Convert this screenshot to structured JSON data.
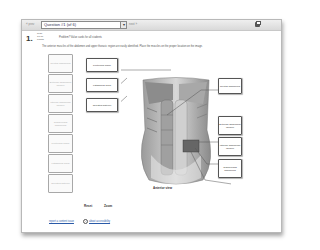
{
  "toolbar": {
    "prev_label": "« prev",
    "question_select": "Question #1 (of 6)",
    "dropdown_arrow": "▾",
    "next_label": "next »",
    "print_icon": "printer-icon"
  },
  "question": {
    "number": "1.",
    "meta": "avail. 10.00 points",
    "guide": "Problem? Value cards for all students",
    "description": "The anterior muscles of the abdomen and upper thoracic region are easily identified. Place the muscles on the proper location on the image."
  },
  "word_bank": [
    {
      "label": "Rectus abdominis"
    },
    {
      "label": "External abdominal oblique"
    },
    {
      "label": "Internal abdominal oblique"
    },
    {
      "label": "Transversus abdominis"
    },
    {
      "label": "Pectoralis major"
    },
    {
      "label": "Latissimus dorsi"
    },
    {
      "label": "Serratus anterior"
    }
  ],
  "left_labels": [
    {
      "label": "Pectoralis major"
    },
    {
      "label": "Latissimus dorsi"
    },
    {
      "label": "Serratus anterior"
    }
  ],
  "right_labels": [
    {
      "label": "Rectus abdominis"
    },
    {
      "label": "External abdominal oblique"
    },
    {
      "label": "Internal abdominal oblique"
    },
    {
      "label": "Transversus abdominis"
    }
  ],
  "figure": {
    "caption": "Anterior view"
  },
  "controls": {
    "reset": "Reset",
    "zoom": "Zoom"
  },
  "footer": {
    "link_a": "report a content issue",
    "help_icon": "?",
    "link_b": "about accessibility"
  }
}
